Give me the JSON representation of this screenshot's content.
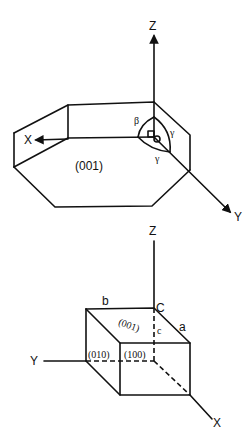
{
  "top_diagram": {
    "axes": {
      "z": "Z",
      "x": "X",
      "y": "Y"
    },
    "face_label": "(001)",
    "angle_labels": {
      "beta": "β",
      "gamma_1": "γ",
      "gamma_2": "γ"
    }
  },
  "bottom_diagram": {
    "axes": {
      "z": "Z",
      "x": "X",
      "y": "Y"
    },
    "edge_labels": {
      "b": "b",
      "a": "a",
      "c": "c",
      "corner": "C"
    },
    "face_labels": {
      "top": "(001)",
      "left": "(010)",
      "front": "(100)"
    }
  },
  "colors": {
    "line": "#111111",
    "background": "#ffffff"
  }
}
